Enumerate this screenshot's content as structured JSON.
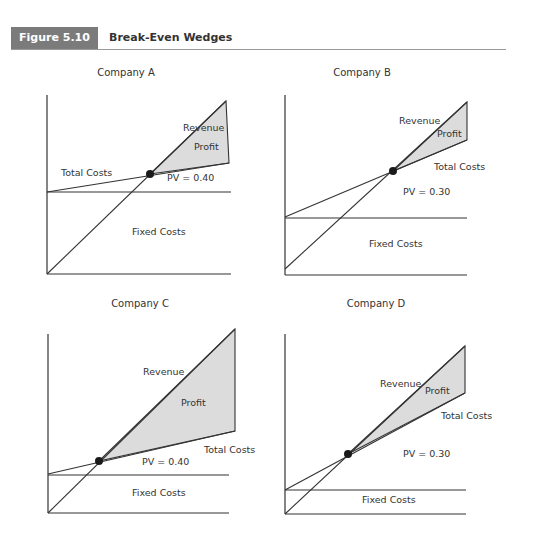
{
  "figure": {
    "label": "Figure 5.10",
    "title": "Break-Even Wedges",
    "label_bg": "#7b7b7b"
  },
  "chart_data": [
    {
      "type": "line",
      "title": "Company A",
      "pv_label": "PV = 0.40",
      "series": [
        {
          "name": "Revenue",
          "points": [
            [
              0,
              0
            ],
            [
              1,
              1
            ]
          ]
        },
        {
          "name": "Total Costs",
          "note": "starts at fixed-cost level, lower slope"
        },
        {
          "name": "Fixed Costs",
          "note": "horizontal line"
        }
      ],
      "annotations": [
        "Revenue",
        "Profit",
        "Total Costs",
        "PV = 0.40",
        "Fixed Costs"
      ],
      "grid": false,
      "px": {
        "axis_x": 47,
        "axis_top": 95,
        "axis_bottom": 274,
        "axis_right": 231,
        "fixed_y": 192,
        "rev_start": [
          47,
          274
        ],
        "rev_end": [
          226,
          101
        ],
        "tc_start": [
          47,
          192
        ],
        "tc_end": [
          229,
          163
        ],
        "be": [
          150,
          174
        ],
        "title_pos": [
          126,
          76
        ],
        "labels": {
          "revenue": [
            183,
            131
          ],
          "profit": [
            194,
            150
          ],
          "total_costs": [
            61,
            176
          ],
          "pv": [
            167,
            181
          ],
          "fixed": [
            132,
            235
          ]
        }
      }
    },
    {
      "type": "line",
      "title": "Company B",
      "pv_label": "PV = 0.30",
      "annotations": [
        "Revenue",
        "Profit",
        "Total Costs",
        "PV = 0.30",
        "Fixed Costs"
      ],
      "grid": false,
      "px": {
        "axis_x": 285,
        "axis_top": 95,
        "axis_bottom": 275,
        "axis_right": 467,
        "fixed_y": 218,
        "rev_start": [
          285,
          269
        ],
        "rev_end": [
          467,
          102
        ],
        "tc_start": [
          285,
          217
        ],
        "tc_end": [
          467,
          140
        ],
        "be": [
          393,
          171
        ],
        "title_pos": [
          362,
          76
        ],
        "labels": {
          "revenue": [
            399,
            124
          ],
          "profit": [
            437,
            137
          ],
          "total_costs": [
            434,
            170
          ],
          "pv": [
            403,
            195
          ],
          "fixed": [
            369,
            247
          ]
        }
      }
    },
    {
      "type": "line",
      "title": "Company C",
      "pv_label": "PV = 0.40",
      "annotations": [
        "Revenue",
        "Profit",
        "Total Costs",
        "PV = 0.40",
        "Fixed Costs"
      ],
      "grid": false,
      "px": {
        "axis_x": 48,
        "axis_top": 334,
        "axis_bottom": 513,
        "axis_right": 229,
        "fixed_y": 475,
        "rev_start": [
          48,
          513
        ],
        "rev_end": [
          235,
          329
        ],
        "tc_start": [
          48,
          474
        ],
        "tc_end": [
          235,
          431
        ],
        "be": [
          99,
          461
        ],
        "title_pos": [
          140,
          307
        ],
        "labels": {
          "revenue": [
            143,
            375
          ],
          "profit": [
            181,
            406
          ],
          "total_costs": [
            204,
            453
          ],
          "pv": [
            142,
            465
          ],
          "fixed": [
            132,
            496
          ]
        }
      }
    },
    {
      "type": "line",
      "title": "Company D",
      "pv_label": "PV = 0.30",
      "annotations": [
        "Revenue",
        "Profit",
        "Total Costs",
        "PV = 0.30",
        "Fixed Costs"
      ],
      "grid": false,
      "px": {
        "axis_x": 285,
        "axis_top": 334,
        "axis_bottom": 514,
        "axis_right": 466,
        "fixed_y": 490,
        "rev_start": [
          285,
          514
        ],
        "rev_end": [
          465,
          346
        ],
        "tc_start": [
          285,
          490
        ],
        "tc_end": [
          465,
          393
        ],
        "be": [
          348,
          454
        ],
        "title_pos": [
          376,
          307
        ],
        "labels": {
          "revenue": [
            380,
            387
          ],
          "profit": [
            425,
            394
          ],
          "total_costs": [
            441,
            419
          ],
          "pv": [
            403,
            457
          ],
          "fixed": [
            362,
            503
          ]
        }
      }
    }
  ]
}
